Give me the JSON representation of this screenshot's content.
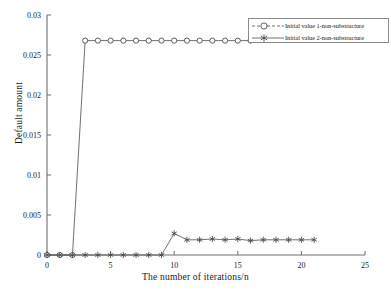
{
  "chart_data": {
    "type": "line",
    "title": "",
    "xlabel": "The number of iterations/n",
    "ylabel": "Default amount",
    "xlim": [
      0,
      25
    ],
    "ylim": [
      0,
      0.03
    ],
    "xticks": [
      0,
      5,
      10,
      15,
      20,
      25
    ],
    "yticks": [
      0,
      0.005,
      0.01,
      0.015,
      0.02,
      0.025,
      0.03
    ],
    "xtick_labels": [
      "0",
      "5",
      "10",
      "15",
      "20",
      "25"
    ],
    "ytick_labels": [
      "0",
      "0.005",
      "0.01",
      "0.015",
      "0.02",
      "0.025",
      "0.03"
    ],
    "grid": false,
    "legend_position": "top-right",
    "series": [
      {
        "name": "Initial value 1-non-substructure",
        "marker": "circle",
        "color": "#4d4d4d",
        "x": [
          0,
          1,
          2,
          3,
          4,
          5,
          6,
          7,
          8,
          9,
          10,
          11,
          12,
          13,
          14,
          15,
          16
        ],
        "values": [
          0,
          0,
          0,
          0.0268,
          0.0268,
          0.0268,
          0.0268,
          0.0268,
          0.0268,
          0.0268,
          0.0268,
          0.0268,
          0.0268,
          0.0268,
          0.0268,
          0.0268,
          0.0268
        ]
      },
      {
        "name": "Initial value 2-non-substructure",
        "marker": "asterisk",
        "color": "#4d4d4d",
        "x": [
          0,
          1,
          2,
          3,
          4,
          5,
          6,
          7,
          8,
          9,
          10,
          11,
          12,
          13,
          14,
          15,
          16,
          17,
          18,
          19,
          20,
          21
        ],
        "values": [
          0,
          0,
          0,
          0,
          0,
          0,
          0,
          0,
          0,
          0,
          0.0027,
          0.0019,
          0.0019,
          0.002,
          0.0019,
          0.002,
          0.0018,
          0.0019,
          0.0019,
          0.0019,
          0.0019,
          0.0019
        ]
      }
    ]
  },
  "legend": {
    "entries": [
      {
        "label": "Initial value 1-non-substructure",
        "marker": "circle-marker"
      },
      {
        "label": "Initial value 2-non-substructure",
        "marker": "asterisk-marker"
      }
    ]
  },
  "axes": {
    "x_title": "The number of iterations/n",
    "y_title": "Default amount"
  },
  "caption": ""
}
